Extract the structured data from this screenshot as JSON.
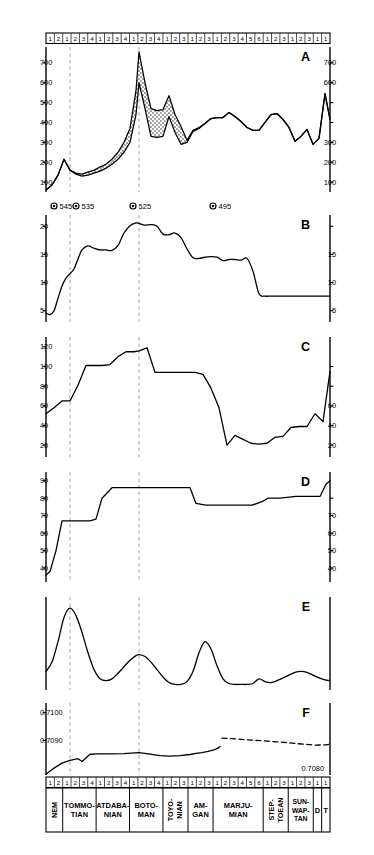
{
  "figure": {
    "width": 374,
    "height": 855,
    "plot_left": 46,
    "plot_right": 330,
    "background": "#ffffff",
    "line_color": "#000000",
    "marker_line_color": "#999999",
    "event_line_1_x": 70,
    "event_line_2_x": 139
  },
  "top_axis": {
    "name": "stage-subdivision-axis-top",
    "cells": [
      "1",
      "2",
      "1",
      "2",
      "3",
      "4",
      "1",
      "2",
      "3",
      "4",
      "1",
      "2",
      "3",
      "4",
      "1",
      "2",
      "3",
      "1",
      "2",
      "3",
      "1",
      "2",
      "3",
      "4",
      "5",
      "6",
      "1",
      "2",
      "3",
      "1",
      "2",
      "3",
      "1",
      "1"
    ]
  },
  "bottom_axis": {
    "name": "stage-subdivision-axis-bottom",
    "cells": [
      "1",
      "2",
      "1",
      "2",
      "3",
      "4",
      "1",
      "2",
      "3",
      "4",
      "1",
      "2",
      "3",
      "4",
      "1",
      "2",
      "3",
      "1",
      "2",
      "3",
      "1",
      "2",
      "3",
      "4",
      "5",
      "6",
      "1",
      "2",
      "3",
      "1",
      "2",
      "3",
      "1",
      "1"
    ],
    "stages": [
      {
        "label": "NEM",
        "lines": [
          "NEM"
        ],
        "span": 2,
        "orientation": "vertical"
      },
      {
        "label": "TOMMOTIAN",
        "lines": [
          "TOMMO-",
          "TIAN"
        ],
        "span": 4,
        "orientation": "horizontal"
      },
      {
        "label": "ATDABANIAN",
        "lines": [
          "ATDABA-",
          "NIAN"
        ],
        "span": 4,
        "orientation": "horizontal"
      },
      {
        "label": "BOTOMAN",
        "lines": [
          "BOTO-",
          "MAN"
        ],
        "span": 4,
        "orientation": "horizontal"
      },
      {
        "label": "TOYONIAN",
        "lines": [
          "TOYO-",
          "NIAN"
        ],
        "span": 3,
        "orientation": "vertical2"
      },
      {
        "label": "AMGAN",
        "lines": [
          "AM-",
          "GAN"
        ],
        "span": 3,
        "orientation": "horizontal"
      },
      {
        "label": "MARJUMIAN",
        "lines": [
          "MARJU-",
          "MIAN"
        ],
        "span": 6,
        "orientation": "horizontal"
      },
      {
        "label": "STEPTOEAN",
        "lines": [
          "STEP-",
          "TOEAN"
        ],
        "span": 3,
        "orientation": "vertical2"
      },
      {
        "label": "SUNWAPTAN",
        "lines": [
          "SUN-",
          "WAP-",
          "TAN"
        ],
        "span": 3,
        "orientation": "horizontal"
      },
      {
        "label": "D",
        "lines": [
          "D"
        ],
        "span": 1,
        "orientation": "horizontal"
      },
      {
        "label": "T",
        "lines": [
          "T"
        ],
        "span": 1,
        "orientation": "horizontal"
      }
    ]
  },
  "age_markers": {
    "name": "age-marker-row",
    "symbol": "circled-dot",
    "unit": "Ma",
    "items": [
      {
        "label": "545",
        "x": 54
      },
      {
        "label": "535",
        "x": 76
      },
      {
        "label": "525",
        "x": 133
      },
      {
        "label": "495",
        "x": 213
      }
    ]
  },
  "chart_data": [
    {
      "type": "area",
      "panel": "A",
      "label": "A",
      "title": "",
      "xlabel": "",
      "ylabel": "",
      "ylim": [
        50,
        780
      ],
      "grid": false,
      "legend": "none",
      "left_ticks": [
        100,
        200,
        300,
        400,
        500,
        600,
        700
      ],
      "right_ticks": [
        100,
        200,
        300,
        400,
        500,
        600,
        700
      ],
      "right_ticks_labeled": [
        100,
        200,
        300,
        600,
        700
      ],
      "fill": "stipple",
      "series": [
        {
          "name": "upper-bound",
          "x": [
            46,
            52,
            58,
            64,
            70,
            76,
            82,
            88,
            94,
            100,
            106,
            112,
            118,
            124,
            130,
            136,
            139,
            145,
            151,
            157,
            163,
            169,
            175,
            181,
            187,
            193,
            199,
            205,
            211,
            217,
            223,
            229,
            235,
            241,
            247,
            253,
            259,
            265,
            271,
            277,
            283,
            289,
            295,
            301,
            307,
            313,
            319,
            325,
            330
          ],
          "values": [
            60,
            85,
            135,
            215,
            160,
            145,
            140,
            150,
            160,
            175,
            190,
            215,
            250,
            300,
            370,
            560,
            755,
            600,
            470,
            460,
            465,
            535,
            440,
            380,
            310,
            360,
            375,
            395,
            420,
            425,
            425,
            450,
            430,
            405,
            375,
            360,
            360,
            400,
            440,
            445,
            415,
            375,
            305,
            330,
            365,
            290,
            320,
            545,
            415
          ]
        },
        {
          "name": "lower-bound",
          "x": [
            46,
            52,
            58,
            64,
            70,
            76,
            82,
            88,
            94,
            100,
            106,
            112,
            118,
            124,
            130,
            136,
            139,
            145,
            151,
            157,
            163,
            169,
            175,
            181,
            187,
            193,
            199,
            205,
            211,
            217,
            223,
            229,
            235,
            241,
            247,
            253,
            259,
            265,
            271,
            277,
            283,
            289,
            295,
            301,
            307,
            313,
            319,
            325,
            330
          ],
          "values": [
            60,
            85,
            135,
            215,
            160,
            140,
            130,
            135,
            145,
            155,
            170,
            190,
            215,
            250,
            300,
            440,
            600,
            470,
            330,
            325,
            330,
            430,
            350,
            290,
            300,
            355,
            370,
            395,
            420,
            425,
            425,
            450,
            430,
            405,
            375,
            360,
            360,
            400,
            440,
            445,
            415,
            375,
            305,
            330,
            365,
            290,
            320,
            545,
            415
          ]
        }
      ]
    },
    {
      "type": "line",
      "panel": "B",
      "label": "B",
      "ylim": [
        3,
        22
      ],
      "grid": false,
      "left_ticks": [
        5,
        10,
        15,
        20
      ],
      "right_ticks": [
        5,
        10,
        15,
        20
      ],
      "right_ticks_labeled": [
        5,
        10,
        15
      ],
      "smooth": true,
      "series": [
        {
          "name": "curve-b",
          "x": [
            46,
            50,
            54,
            58,
            62,
            66,
            70,
            74,
            78,
            82,
            88,
            94,
            100,
            106,
            112,
            118,
            124,
            130,
            136,
            139,
            145,
            151,
            157,
            163,
            169,
            175,
            181,
            187,
            193,
            199,
            205,
            211,
            217,
            223,
            229,
            235,
            241,
            247,
            253,
            259,
            265,
            271,
            277,
            283,
            289,
            295,
            301,
            307,
            313,
            319,
            325,
            330
          ],
          "values": [
            4.6,
            4.3,
            5.0,
            7.2,
            9.4,
            10.8,
            11.6,
            12.4,
            14.2,
            15.8,
            16.5,
            16.1,
            15.8,
            15.8,
            15.7,
            16.6,
            18.8,
            20.1,
            20.6,
            20.5,
            20.2,
            20.3,
            20.0,
            18.6,
            18.5,
            18.8,
            18.0,
            16.0,
            14.4,
            14.3,
            14.5,
            14.6,
            14.5,
            13.9,
            14.1,
            14.1,
            14.0,
            14.3,
            12.0,
            8.0,
            7.6,
            7.6,
            7.6,
            7.6,
            7.6,
            7.6,
            7.6,
            7.6,
            7.6,
            7.6,
            7.6,
            7.6
          ]
        }
      ]
    },
    {
      "type": "line",
      "panel": "C",
      "label": "C",
      "ylim": [
        8,
        130
      ],
      "grid": false,
      "left_ticks": [
        20,
        40,
        60,
        80,
        100,
        120
      ],
      "right_ticks": [
        20,
        40,
        60,
        80,
        100
      ],
      "right_ticks_labeled": [
        20,
        40,
        60
      ],
      "series": [
        {
          "name": "curve-c",
          "x": [
            46,
            54,
            62,
            70,
            78,
            86,
            94,
            102,
            110,
            118,
            126,
            134,
            139,
            147,
            155,
            163,
            171,
            179,
            187,
            195,
            203,
            211,
            219,
            227,
            235,
            243,
            251,
            259,
            267,
            275,
            283,
            291,
            299,
            307,
            315,
            323,
            330
          ],
          "values": [
            52,
            58,
            65,
            65,
            81,
            101,
            101,
            101,
            102,
            110,
            115,
            115,
            116,
            119,
            94,
            94,
            94,
            94,
            94,
            94,
            92,
            78,
            58,
            20,
            30,
            26,
            22,
            21,
            22,
            28,
            29,
            38,
            39,
            39,
            52,
            44,
            95
          ]
        }
      ]
    },
    {
      "type": "line",
      "panel": "D",
      "label": "D",
      "ylim": [
        32,
        95
      ],
      "grid": false,
      "left_ticks": [
        40,
        50,
        60,
        70,
        80,
        90
      ],
      "right_ticks": [
        40,
        50,
        60,
        70,
        80
      ],
      "right_ticks_labeled": [
        40,
        50,
        60,
        70
      ],
      "series": [
        {
          "name": "curve-d",
          "x": [
            46,
            50,
            56,
            62,
            70,
            84,
            90,
            96,
            102,
            112,
            124,
            139,
            155,
            171,
            183,
            190,
            196,
            206,
            220,
            236,
            252,
            262,
            268,
            280,
            296,
            312,
            320,
            326,
            330
          ],
          "values": [
            36,
            38,
            50,
            67,
            67,
            67,
            67,
            68,
            80,
            86,
            86,
            86,
            86,
            86,
            86,
            86,
            77,
            76,
            76,
            76,
            76,
            78,
            80,
            80,
            81,
            81,
            81,
            88,
            90
          ]
        }
      ]
    },
    {
      "type": "line",
      "panel": "E",
      "label": "E",
      "ylim": [
        0,
        1
      ],
      "grid": false,
      "left_ticks": [],
      "right_ticks": [],
      "smooth": true,
      "series": [
        {
          "name": "curve-e",
          "x": [
            46,
            52,
            58,
            64,
            70,
            76,
            82,
            88,
            94,
            100,
            106,
            112,
            118,
            124,
            130,
            136,
            139,
            145,
            151,
            157,
            163,
            169,
            175,
            181,
            187,
            193,
            199,
            205,
            211,
            217,
            223,
            229,
            235,
            241,
            247,
            253,
            259,
            265,
            271,
            277,
            283,
            289,
            295,
            301,
            307,
            313,
            319,
            325,
            330
          ],
          "values": [
            0.2,
            0.3,
            0.52,
            0.78,
            0.88,
            0.8,
            0.62,
            0.4,
            0.22,
            0.12,
            0.1,
            0.12,
            0.18,
            0.25,
            0.32,
            0.37,
            0.38,
            0.36,
            0.3,
            0.22,
            0.14,
            0.08,
            0.06,
            0.06,
            0.09,
            0.2,
            0.4,
            0.52,
            0.44,
            0.26,
            0.12,
            0.07,
            0.06,
            0.06,
            0.06,
            0.07,
            0.12,
            0.09,
            0.08,
            0.1,
            0.13,
            0.16,
            0.19,
            0.2,
            0.19,
            0.16,
            0.13,
            0.11,
            0.1
          ]
        }
      ]
    },
    {
      "type": "line",
      "panel": "F",
      "label": "F",
      "ylabel": "87Sr/86Sr",
      "ylim": [
        0.70775,
        0.71035
      ],
      "grid": false,
      "left_ticks": [
        0.709,
        0.71
      ],
      "left_tick_labels": [
        "0.7090",
        "0.7100"
      ],
      "corner_label": "0.7080",
      "series": [
        {
          "name": "sr-solid",
          "style": "solid",
          "x": [
            46,
            54,
            62,
            70,
            78,
            82,
            90,
            98,
            110,
            124,
            139,
            150,
            160,
            170,
            180,
            190,
            196,
            202,
            208,
            214,
            218,
            220
          ],
          "values": [
            0.70778,
            0.708,
            0.70818,
            0.70828,
            0.70834,
            0.70824,
            0.7085,
            0.70851,
            0.70851,
            0.70852,
            0.70856,
            0.7085,
            0.70845,
            0.70843,
            0.70845,
            0.70849,
            0.70853,
            0.70856,
            0.7086,
            0.70866,
            0.70872,
            0.70878
          ]
        },
        {
          "name": "sr-dashed",
          "style": "dashed",
          "x": [
            222,
            232,
            244,
            256,
            268,
            280,
            292,
            304,
            316,
            326,
            330
          ],
          "values": [
            0.70908,
            0.70906,
            0.70903,
            0.709,
            0.70897,
            0.70894,
            0.7089,
            0.70886,
            0.70883,
            0.70884,
            0.70886
          ]
        }
      ]
    }
  ]
}
